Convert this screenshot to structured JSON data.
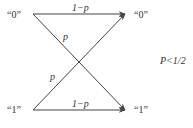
{
  "diagram": {
    "type": "binary-symmetric-channel",
    "input_nodes": [
      {
        "label": "“0”"
      },
      {
        "label": "“1”"
      }
    ],
    "output_nodes": [
      {
        "label": "“0”"
      },
      {
        "label": "“1”"
      }
    ],
    "edges": [
      {
        "from": "0",
        "to": "0",
        "label": "1−p"
      },
      {
        "from": "0",
        "to": "1",
        "label": "p"
      },
      {
        "from": "1",
        "to": "0",
        "label": "p"
      },
      {
        "from": "1",
        "to": "1",
        "label": "1−p"
      }
    ],
    "condition": "P<1/2",
    "line_color": "#444444"
  }
}
